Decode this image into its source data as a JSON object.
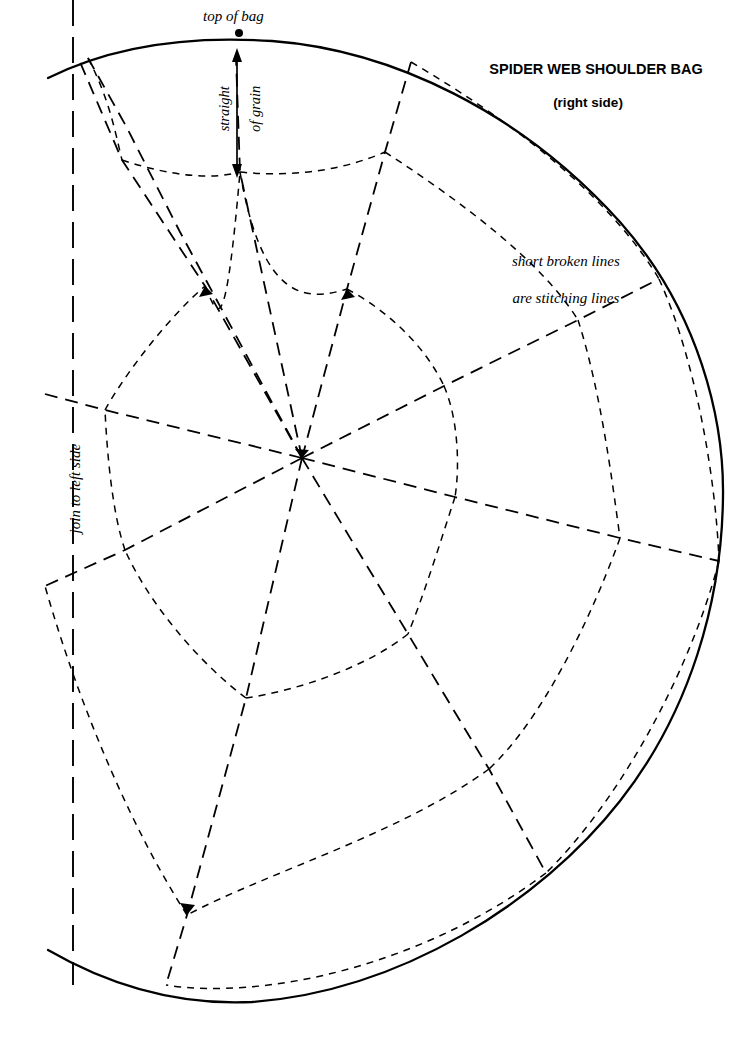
{
  "document": {
    "kind": "sewing-pattern-sheet",
    "background_color": "#ffffff",
    "ink_color": "#000000",
    "width": 747,
    "height": 1039
  },
  "title": {
    "main": "SPIDER WEB SHOULDER BAG",
    "subtitle": "(right side)"
  },
  "labels": {
    "top_of_bag": "top of bag",
    "straight_of_grain_line1": "straight",
    "straight_of_grain_line2": "of grain",
    "straight_of_grain": "straight of grain",
    "join_to_left_side": "join to left side",
    "stitching_note_line1": "short broken lines",
    "stitching_note_line2": "are stitching lines"
  },
  "pattern": {
    "piece_outline_style": "solid",
    "fold_line_style": "long-dash",
    "web_spoke_style": "dashed",
    "stitching_line_style": "short-dash",
    "web_center": {
      "x": 302,
      "y": 458
    },
    "top_of_bag_marker": {
      "x": 239,
      "y": 33
    },
    "grain_arrow": {
      "x": 237,
      "y_top": 55,
      "y_bottom": 170
    },
    "fold_line_x": 73,
    "spoke_count": 10,
    "web_rings": 4
  },
  "geometry": {
    "outline": "M 48 78 C 120 40 200 35 272 40 C 390 48 520 110 620 220 C 700 310 724 420 723 495 C 722 600 690 710 620 800 C 540 902 400 990 252 1002 C 170 1006 100 980 48 950",
    "fold_line": {
      "x": 73,
      "y1": 0,
      "y2": 985
    },
    "spokes": [
      {
        "name": "spoke-n",
        "d": "M 302 458 L 240 170 L 236 60"
      },
      {
        "name": "spoke-nne",
        "d": "M 302 458 L 346 290 L 384 152 L 410 62"
      },
      {
        "name": "spoke-ene",
        "d": "M 302 458 L 444 386 L 578 320 L 658 279"
      },
      {
        "name": "spoke-e",
        "d": "M 302 458 L 455 497 L 620 538 L 718 560"
      },
      {
        "name": "spoke-ese",
        "d": "M 302 458 L 408 634 L 488 768 L 545 872"
      },
      {
        "name": "spoke-s",
        "d": "M 302 458 L 246 698 L 187 915 L 165 985"
      },
      {
        "name": "spoke-wsw",
        "d": "M 302 458 L 125 550 L 45 585"
      },
      {
        "name": "spoke-w",
        "d": "M 302 458 L 105 410 L 45 395"
      },
      {
        "name": "spoke-wnw",
        "d": "M 302 458 L 205 286 L 122 160 L 80 62"
      },
      {
        "name": "spoke-nw",
        "d": "M 302 458 L 140 142 L 88 58"
      }
    ],
    "web_arcs": [
      {
        "ring": 1,
        "d": "M 205 286 C 250 300 300 300 346 290"
      },
      {
        "ring": 1,
        "d": "M 346 290 C 390 310 425 345 444 386"
      },
      {
        "ring": 1,
        "d": "M 444 386 C 456 415 458 465 455 497"
      },
      {
        "ring": 1,
        "d": "M 455 497 C 440 540 425 590 408 634"
      },
      {
        "ring": 1,
        "d": "M 408 634 C 370 665 300 690 246 698"
      },
      {
        "ring": 1,
        "d": "M 246 698 C 200 660 150 600 125 550"
      },
      {
        "ring": 1,
        "d": "M 125 550 C 112 510 108 452 105 410"
      },
      {
        "ring": 1,
        "d": "M 105 410 C 125 372 170 316 205 286"
      },
      {
        "ring": 2,
        "d": "M 122 160 C 200 190 310 185 384 152"
      },
      {
        "ring": 2,
        "d": "M 384 152 C 460 200 540 262 578 320"
      },
      {
        "ring": 2,
        "d": "M 578 320 C 600 390 610 480 620 538"
      },
      {
        "ring": 2,
        "d": "M 620 538 C 590 620 540 720 488 768"
      },
      {
        "ring": 2,
        "d": "M 488 768 C 400 832 270 870 187 915"
      },
      {
        "ring": 2,
        "d": "M 187 915 C 130 830 70 730 45 585"
      },
      {
        "ring": 3,
        "d": "M 80 62 C 140 120 170 220 122 160"
      }
    ]
  }
}
